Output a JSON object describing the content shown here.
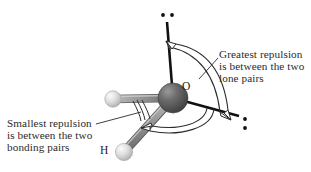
{
  "figure": {
    "kind": "molecular-geometry-diagram",
    "molecule": "water",
    "background_color": "#ffffff"
  },
  "annotations": {
    "right": {
      "name": "greatest-repulsion-note",
      "line1": "Greatest repulsion",
      "line2": "is between the two",
      "line3": "lone pairs"
    },
    "left": {
      "name": "smallest-repulsion-note",
      "line1": "Smallest repulsion",
      "line2": "is between the two",
      "line3": "bonding pairs"
    }
  },
  "atoms": [
    {
      "id": "oxygen",
      "label": "O",
      "label_x": 185,
      "label_y": 87,
      "cx": 173,
      "cy": 98,
      "r": 15,
      "color": "#585858",
      "highlight_color": "#8d8d8d"
    },
    {
      "id": "hydrogen-left",
      "label": "",
      "cx": 113,
      "cy": 99,
      "r": 8,
      "color": "#d8d8d8",
      "highlight_color": "#f4f4f4"
    },
    {
      "id": "hydrogen-bottom",
      "label": "H",
      "label_x": 105,
      "label_y": 152,
      "cx": 124,
      "cy": 152,
      "r": 8.5,
      "color": "#d8d8d8",
      "highlight_color": "#f4f4f4"
    }
  ],
  "bonds": [
    {
      "id": "bond-o-h-left",
      "x1": 173,
      "y1": 98,
      "x2": 113,
      "y2": 99,
      "color": "#8b8b8b",
      "width": 7
    },
    {
      "id": "bond-o-h-bottom",
      "x1": 173,
      "y1": 98,
      "x2": 124,
      "y2": 152,
      "color": "#8b8b8b",
      "width": 7.5
    }
  ],
  "lone_pairs": [
    {
      "id": "lone-pair-top",
      "axis": {
        "x1": 173,
        "y1": 98,
        "x2": 167,
        "y2": 22
      },
      "axis_color": "#111111",
      "dots": [
        {
          "cx": 163,
          "cy": 15,
          "r": 1.8
        },
        {
          "cx": 172,
          "cy": 15,
          "r": 1.8
        }
      ],
      "dot_color": "#111111"
    },
    {
      "id": "lone-pair-right",
      "axis": {
        "x1": 173,
        "y1": 98,
        "x2": 239,
        "y2": 116
      },
      "axis_color": "#111111",
      "dots": [
        {
          "cx": 245,
          "cy": 119,
          "r": 1.8
        },
        {
          "cx": 245,
          "cy": 128,
          "r": 1.8
        }
      ],
      "dot_color": "#111111"
    }
  ],
  "repulsion_arcs": [
    {
      "id": "arc-greatest-repulsion",
      "description": "large double-headed arc spanning the two lone pairs",
      "color": "#2b2b2b",
      "arrowheads": 2
    },
    {
      "id": "arc-lone-bonding",
      "description": "medium arc between right lone pair and bottom bonding pair",
      "color": "#2b2b2b",
      "arrowheads": 1
    },
    {
      "id": "arc-smallest-repulsion",
      "description": "small double arc between the two bonding pairs",
      "color": "#2b2b2b",
      "arrowheads": 0
    }
  ],
  "leader_lines": [
    {
      "id": "leader-right",
      "x1": 218,
      "y1": 58,
      "x2": 198,
      "y2": 80
    },
    {
      "id": "leader-left",
      "x1": 96,
      "y1": 124,
      "x2": 140,
      "y2": 113
    }
  ],
  "colors": {
    "oxygen": "#585858",
    "hydrogen": "#d8d8d8",
    "bond": "#8b8b8b",
    "lone_pair_axis": "#111111",
    "text": "#2b2b2b",
    "arc": "#2b2b2b"
  }
}
